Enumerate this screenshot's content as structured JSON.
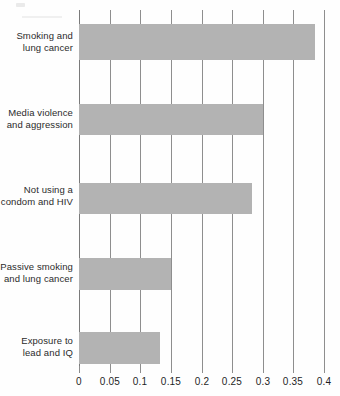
{
  "chart_data": {
    "type": "bar",
    "orientation": "horizontal",
    "title": "",
    "subtitle": "",
    "xlabel": "",
    "ylabel": "",
    "categories": [
      "Smoking and\nlung cancer",
      "Media violence\nand aggression",
      "Not using a\ncondom and HIV",
      "Passive smoking\nand lung cancer",
      "Exposure to\nlead and IQ"
    ],
    "values": [
      0.385,
      0.3,
      0.282,
      0.15,
      0.132
    ],
    "xlim": [
      0,
      0.4
    ],
    "xticks": [
      0,
      0.05,
      0.1,
      0.15,
      0.2,
      0.25,
      0.3,
      0.35,
      0.4
    ],
    "xtick_labels": [
      "0",
      "0.05",
      "0.1",
      "0.15",
      "0.2",
      "0.25",
      "0.3",
      "0.35",
      "0.4"
    ],
    "grid": true,
    "grid_axis": "x",
    "legend": null,
    "bar_color": "#b3b3b3",
    "grid_color": "#8e8e8e",
    "axis_color": "#7a7a7a",
    "background": "#fefefe"
  },
  "categories_display": [
    {
      "line1": "Smoking and",
      "line2": "lung cancer"
    },
    {
      "line1": "Media violence",
      "line2": "and aggression"
    },
    {
      "line1": "Not using a",
      "line2": "condom and HIV"
    },
    {
      "line1": "Passive smoking",
      "line2": "and lung cancer"
    },
    {
      "line1": "Exposure to",
      "line2": "lead and IQ"
    }
  ]
}
